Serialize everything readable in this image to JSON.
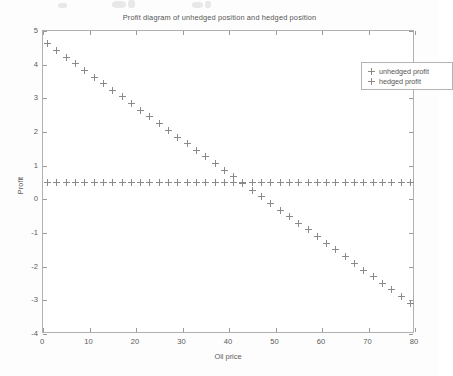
{
  "chart_data": {
    "type": "scatter",
    "title": "Profit diagram of unhedged position and hedged position",
    "xlabel": "Oil price",
    "ylabel": "Profit",
    "xlim": [
      0,
      80
    ],
    "ylim": [
      -4,
      5
    ],
    "xticks": [
      0,
      10,
      20,
      30,
      40,
      50,
      60,
      70,
      80
    ],
    "yticks": [
      -4,
      -3,
      -2,
      -1,
      0,
      1,
      2,
      3,
      4,
      5
    ],
    "grid": false,
    "legend_position": "upper right",
    "marker": "+",
    "series": [
      {
        "name": "unhedged profit",
        "marker": "+",
        "color": "#8a8a8a",
        "x": [
          1,
          3,
          5,
          7,
          9,
          11,
          13,
          15,
          17,
          19,
          21,
          23,
          25,
          27,
          29,
          31,
          33,
          35,
          37,
          39,
          41,
          43,
          45,
          47,
          49,
          51,
          53,
          55,
          57,
          59,
          61,
          63,
          65,
          67,
          69,
          71,
          73,
          75,
          77,
          79
        ],
        "y": [
          4.62,
          4.42,
          4.22,
          4.03,
          3.83,
          3.63,
          3.43,
          3.24,
          3.04,
          2.84,
          2.64,
          2.45,
          2.25,
          2.05,
          1.85,
          1.66,
          1.46,
          1.26,
          1.06,
          0.87,
          0.67,
          0.47,
          0.27,
          0.08,
          -0.12,
          -0.32,
          -0.52,
          -0.71,
          -0.91,
          -1.11,
          -1.31,
          -1.5,
          -1.7,
          -1.9,
          -2.1,
          -2.29,
          -2.49,
          -2.69,
          -2.89,
          -3.08
        ]
      },
      {
        "name": "hedged profit",
        "marker": "+",
        "color": "#8a8a8a",
        "x": [
          1,
          3,
          5,
          7,
          9,
          11,
          13,
          15,
          17,
          19,
          21,
          23,
          25,
          27,
          29,
          31,
          33,
          35,
          37,
          39,
          41,
          43,
          45,
          47,
          49,
          51,
          53,
          55,
          57,
          59,
          61,
          63,
          65,
          67,
          69,
          71,
          73,
          75,
          77,
          79
        ],
        "y": [
          0.5,
          0.5,
          0.5,
          0.5,
          0.5,
          0.5,
          0.5,
          0.5,
          0.5,
          0.5,
          0.5,
          0.5,
          0.5,
          0.5,
          0.5,
          0.5,
          0.5,
          0.5,
          0.5,
          0.5,
          0.5,
          0.5,
          0.5,
          0.5,
          0.5,
          0.5,
          0.5,
          0.5,
          0.5,
          0.5,
          0.5,
          0.5,
          0.5,
          0.5,
          0.5,
          0.5,
          0.5,
          0.5,
          0.5,
          0.5
        ]
      }
    ]
  }
}
